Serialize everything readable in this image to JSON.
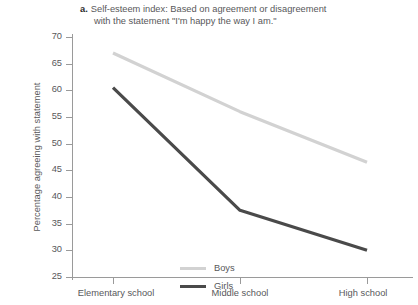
{
  "caption": {
    "marker": "a.",
    "line1": "Self-esteem index:  Based on agreement or disagreement",
    "line2": "with the statement \"I'm happy the way I am.\""
  },
  "legend": {
    "position": "inside-lower-left",
    "entries": [
      {
        "label": "Boys",
        "color": "#d2d2d2"
      },
      {
        "label": "Girls",
        "color": "#4a4a4a"
      }
    ]
  },
  "axes": {
    "y_title": "Percentage agreeing with statement",
    "y_ticks": [
      "70",
      "65",
      "60",
      "55",
      "50",
      "45",
      "40",
      "35",
      "30",
      "25"
    ],
    "x_ticks": [
      "Elementary school",
      "Middle school",
      "High school"
    ]
  },
  "chart_data": {
    "type": "line",
    "title": "Self-esteem index:  Based on agreement or disagreement with the statement \"I'm happy the way I am.\"",
    "xlabel": "",
    "ylabel": "Percentage agreeing with statement",
    "categories": [
      "Elementary school",
      "Middle school",
      "High school"
    ],
    "series": [
      {
        "name": "Boys",
        "values": [
          67,
          56,
          46.5
        ],
        "color": "#d2d2d2"
      },
      {
        "name": "Girls",
        "values": [
          60.5,
          37.5,
          30
        ],
        "color": "#4a4a4a"
      }
    ],
    "ylim": [
      25,
      70
    ],
    "ytick_step": 5,
    "grid": false,
    "legend_position": "inside-lower-left"
  }
}
